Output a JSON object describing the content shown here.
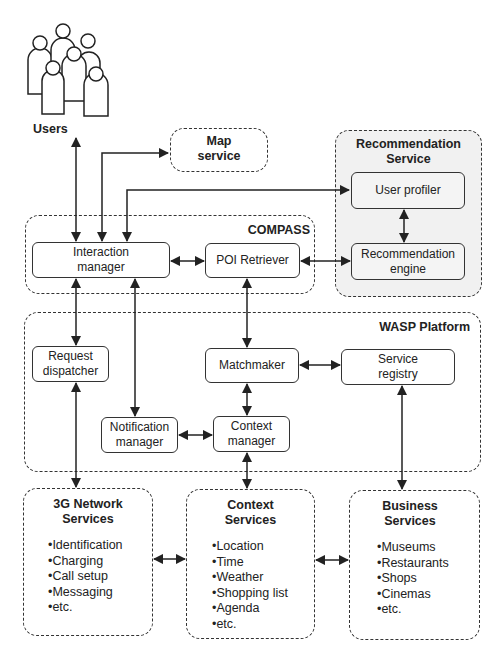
{
  "users": {
    "label": "Users",
    "icon": "users-group-icon"
  },
  "map_service": {
    "title": "Map\nservice"
  },
  "recommendation_service": {
    "title": "Recommendation\nService",
    "components": {
      "user_profiler": "User profiler",
      "recommendation_engine": "Recommendation\nengine"
    }
  },
  "compass": {
    "title": "COMPASS",
    "components": {
      "interaction_manager": "Interaction\nmanager",
      "poi_retriever": "POI Retriever"
    }
  },
  "wasp_platform": {
    "title": "WASP Platform",
    "components": {
      "request_dispatcher": "Request\ndispatcher",
      "matchmaker": "Matchmaker",
      "service_registry": "Service\nregistry",
      "notification_manager": "Notification\nmanager",
      "context_manager": "Context\nmanager"
    }
  },
  "network_services": {
    "title": "3G Network\nServices",
    "items": [
      "•Identification",
      "•Charging",
      "•Call setup",
      "•Messaging",
      "•etc."
    ]
  },
  "context_services": {
    "title": "Context\nServices",
    "items": [
      "•Location",
      "•Time",
      "•Weather",
      "•Shopping list",
      "•Agenda",
      "•etc."
    ]
  },
  "business_services": {
    "title": "Business\nServices",
    "items": [
      "•Museums",
      "•Restaurants",
      "•Shops",
      "•Cinemas",
      "•etc."
    ]
  },
  "connections": [
    [
      "interaction_manager",
      "users"
    ],
    [
      "interaction_manager",
      "map_service"
    ],
    [
      "interaction_manager",
      "user_profiler"
    ],
    [
      "interaction_manager",
      "poi_retriever"
    ],
    [
      "poi_retriever",
      "recommendation_engine"
    ],
    [
      "user_profiler",
      "recommendation_engine"
    ],
    [
      "interaction_manager",
      "request_dispatcher"
    ],
    [
      "interaction_manager",
      "notification_manager"
    ],
    [
      "poi_retriever",
      "matchmaker"
    ],
    [
      "matchmaker",
      "service_registry"
    ],
    [
      "matchmaker",
      "context_manager"
    ],
    [
      "notification_manager",
      "context_manager"
    ],
    [
      "request_dispatcher",
      "network_services"
    ],
    [
      "context_manager",
      "context_services"
    ],
    [
      "service_registry",
      "business_services"
    ],
    [
      "network_services",
      "context_services"
    ],
    [
      "context_services",
      "business_services"
    ]
  ],
  "colors": {
    "line": "#222222",
    "group_shade": "#f1f1f1",
    "background": "#ffffff"
  }
}
